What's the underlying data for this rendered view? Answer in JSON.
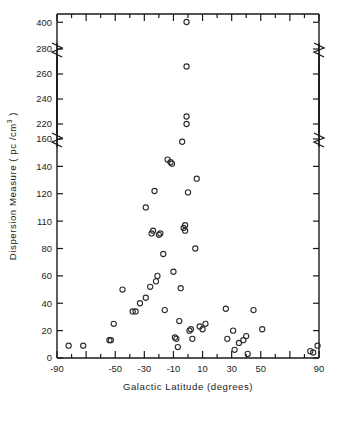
{
  "figure": {
    "background": "#ffffff",
    "ink_color": "#1a1a1a",
    "marker_color": "#2b2b2b",
    "marker_style": "open-circle"
  },
  "chart_data": {
    "type": "scatter",
    "title": "",
    "xlabel": "Galactic Latitude (degrees)",
    "ylabel": "Dispersion Measure ( pc / cm3 )",
    "ylabel_display": "Dispersion Measure ( pc /cm",
    "ylabel_exponent": "3",
    "ylabel_tail": " )",
    "grid": false,
    "legend": "none",
    "xlim": [
      -90,
      90
    ],
    "xticks": [
      -90,
      -70,
      -50,
      -30,
      -10,
      10,
      30,
      50,
      70,
      90
    ],
    "xticklabels": [
      "-90",
      "",
      "-50",
      "-30",
      "-10",
      "10",
      "30",
      "50",
      "",
      "90"
    ],
    "xtick_minor_step": 10,
    "ylim": [
      0,
      410
    ],
    "yticks": [
      0,
      20,
      40,
      60,
      80,
      100,
      120,
      140,
      160,
      220,
      240,
      260,
      280,
      400
    ],
    "yticklabels": [
      "0",
      "20",
      "40",
      "60",
      "80",
      "110",
      "120",
      "140",
      "160",
      "220",
      "240",
      "260",
      "280",
      "400"
    ],
    "axis_breaks": [
      {
        "between": [
          160,
          220
        ],
        "style": "zigzag"
      },
      {
        "between": [
          280,
          400
        ],
        "style": "zigzag"
      }
    ],
    "points": [
      {
        "x": -82,
        "y": 9
      },
      {
        "x": -72,
        "y": 9
      },
      {
        "x": -54,
        "y": 13
      },
      {
        "x": -53,
        "y": 13
      },
      {
        "x": -51,
        "y": 25
      },
      {
        "x": -45,
        "y": 50
      },
      {
        "x": -38,
        "y": 34
      },
      {
        "x": -36,
        "y": 34
      },
      {
        "x": -33,
        "y": 40
      },
      {
        "x": -29,
        "y": 44
      },
      {
        "x": -29,
        "y": 110
      },
      {
        "x": -26,
        "y": 52
      },
      {
        "x": -25,
        "y": 91
      },
      {
        "x": -24,
        "y": 93
      },
      {
        "x": -23,
        "y": 122
      },
      {
        "x": -22,
        "y": 56
      },
      {
        "x": -21,
        "y": 60
      },
      {
        "x": -20,
        "y": 90
      },
      {
        "x": -19,
        "y": 91
      },
      {
        "x": -17,
        "y": 76
      },
      {
        "x": -16,
        "y": 35
      },
      {
        "x": -14,
        "y": 145
      },
      {
        "x": -12,
        "y": 143
      },
      {
        "x": -11,
        "y": 142
      },
      {
        "x": -10,
        "y": 63
      },
      {
        "x": -9,
        "y": 15
      },
      {
        "x": -8,
        "y": 14
      },
      {
        "x": -7,
        "y": 8
      },
      {
        "x": -6,
        "y": 27
      },
      {
        "x": -5,
        "y": 51
      },
      {
        "x": -4,
        "y": 158
      },
      {
        "x": -3,
        "y": 95
      },
      {
        "x": -2,
        "y": 97
      },
      {
        "x": -2,
        "y": 93
      },
      {
        "x": -1,
        "y": 226
      },
      {
        "x": -1,
        "y": 220
      },
      {
        "x": -1,
        "y": 266
      },
      {
        "x": -1,
        "y": 401
      },
      {
        "x": 0,
        "y": 121
      },
      {
        "x": 1,
        "y": 20
      },
      {
        "x": 2,
        "y": 21
      },
      {
        "x": 3,
        "y": 14
      },
      {
        "x": 5,
        "y": 80
      },
      {
        "x": 6,
        "y": 131
      },
      {
        "x": 8,
        "y": 23
      },
      {
        "x": 10,
        "y": 21
      },
      {
        "x": 12,
        "y": 25
      },
      {
        "x": 26,
        "y": 36
      },
      {
        "x": 27,
        "y": 14
      },
      {
        "x": 31,
        "y": 20
      },
      {
        "x": 32,
        "y": 6
      },
      {
        "x": 35,
        "y": 11
      },
      {
        "x": 38,
        "y": 13
      },
      {
        "x": 40,
        "y": 16
      },
      {
        "x": 41,
        "y": 3
      },
      {
        "x": 45,
        "y": 35
      },
      {
        "x": 51,
        "y": 21
      },
      {
        "x": 84,
        "y": 5
      },
      {
        "x": 86,
        "y": 4
      },
      {
        "x": 89,
        "y": 9
      }
    ]
  }
}
